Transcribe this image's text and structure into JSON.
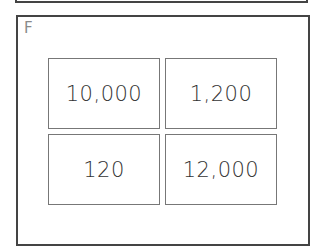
{
  "panel": {
    "label": "F",
    "cards": [
      {
        "value": "10,000"
      },
      {
        "value": "1,200"
      },
      {
        "value": "120"
      },
      {
        "value": "12,000"
      }
    ]
  }
}
